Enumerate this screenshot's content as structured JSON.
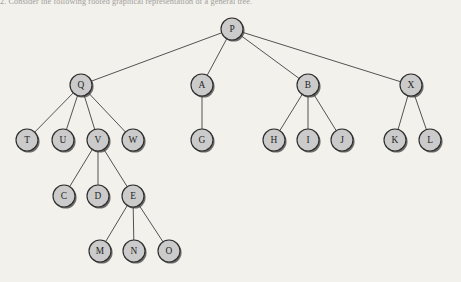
{
  "caption": {
    "text": "2.   Consider the following rooted graphical representation of a general tree."
  },
  "colors": {
    "background": "#f3f1ec",
    "node_fill": "#cbcbcb",
    "node_stroke": "#2e2e2e",
    "node_shadow": "#3b3b3b",
    "edge_stroke": "#4a4a4a",
    "label_text": "#232323"
  },
  "diagram": {
    "type": "rooted-general-tree",
    "node_radius": 11,
    "root": "P",
    "nodes": [
      {
        "id": "P",
        "label": "P",
        "x": 232,
        "y": 29,
        "level": 0
      },
      {
        "id": "Q",
        "label": "Q",
        "x": 81,
        "y": 85,
        "level": 1
      },
      {
        "id": "A",
        "label": "A",
        "x": 202,
        "y": 85,
        "level": 1
      },
      {
        "id": "B",
        "label": "B",
        "x": 308,
        "y": 85,
        "level": 1
      },
      {
        "id": "X",
        "label": "X",
        "x": 411,
        "y": 85,
        "level": 1
      },
      {
        "id": "T",
        "label": "T",
        "x": 27,
        "y": 140,
        "level": 2
      },
      {
        "id": "U",
        "label": "U",
        "x": 63,
        "y": 140,
        "level": 2
      },
      {
        "id": "V",
        "label": "V",
        "x": 98,
        "y": 140,
        "level": 2
      },
      {
        "id": "W",
        "label": "W",
        "x": 133,
        "y": 140,
        "level": 2
      },
      {
        "id": "G",
        "label": "G",
        "x": 202,
        "y": 140,
        "level": 2
      },
      {
        "id": "H",
        "label": "H",
        "x": 274,
        "y": 140,
        "level": 2
      },
      {
        "id": "I",
        "label": "I",
        "x": 308,
        "y": 140,
        "level": 2
      },
      {
        "id": "J",
        "label": "J",
        "x": 342,
        "y": 140,
        "level": 2
      },
      {
        "id": "K",
        "label": "K",
        "x": 395,
        "y": 140,
        "level": 2
      },
      {
        "id": "L",
        "label": "L",
        "x": 430,
        "y": 140,
        "level": 2
      },
      {
        "id": "C",
        "label": "C",
        "x": 64,
        "y": 196,
        "level": 3
      },
      {
        "id": "D",
        "label": "D",
        "x": 98,
        "y": 196,
        "level": 3
      },
      {
        "id": "E",
        "label": "E",
        "x": 133,
        "y": 196,
        "level": 3
      },
      {
        "id": "M",
        "label": "M",
        "x": 100,
        "y": 251,
        "level": 4
      },
      {
        "id": "N",
        "label": "N",
        "x": 134,
        "y": 251,
        "level": 4
      },
      {
        "id": "O",
        "label": "O",
        "x": 169,
        "y": 251,
        "level": 4
      }
    ],
    "edges": [
      {
        "from": "P",
        "to": "Q"
      },
      {
        "from": "P",
        "to": "A"
      },
      {
        "from": "P",
        "to": "B"
      },
      {
        "from": "P",
        "to": "X"
      },
      {
        "from": "Q",
        "to": "T"
      },
      {
        "from": "Q",
        "to": "U"
      },
      {
        "from": "Q",
        "to": "V"
      },
      {
        "from": "Q",
        "to": "W"
      },
      {
        "from": "A",
        "to": "G"
      },
      {
        "from": "B",
        "to": "H"
      },
      {
        "from": "B",
        "to": "I"
      },
      {
        "from": "B",
        "to": "J"
      },
      {
        "from": "X",
        "to": "K"
      },
      {
        "from": "X",
        "to": "L"
      },
      {
        "from": "V",
        "to": "C"
      },
      {
        "from": "V",
        "to": "D"
      },
      {
        "from": "V",
        "to": "E"
      },
      {
        "from": "E",
        "to": "M"
      },
      {
        "from": "E",
        "to": "N"
      },
      {
        "from": "E",
        "to": "O"
      }
    ]
  }
}
